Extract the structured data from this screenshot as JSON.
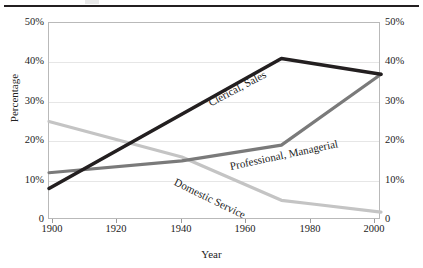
{
  "figure": {
    "has_top_rule": true
  },
  "axes": {
    "xlabel": "Year",
    "ylabel": "Percentage",
    "y_ticks_left": [
      "50%",
      "40%",
      "30%",
      "20%",
      "10%",
      "0"
    ],
    "y_ticks_right": [
      "50%",
      "40%",
      "30%",
      "20%",
      "10%",
      "0"
    ],
    "x_ticks": [
      "1900",
      "1920",
      "1940",
      "1960",
      "1980",
      "2000"
    ]
  },
  "colors": {
    "clerical": "#231f20",
    "professional": "#7a7a7a",
    "domestic": "#c4c4c4",
    "grid": "#e6e6e6",
    "frame": "#b9b9b9"
  },
  "chart_data": {
    "type": "line",
    "title": "",
    "xlabel": "Year",
    "ylabel": "Percentage",
    "xlim": [
      1900,
      2000
    ],
    "ylim": [
      0,
      50
    ],
    "grid": true,
    "legend_position": "inline-annotations",
    "y_tick_values": [
      0,
      10,
      20,
      30,
      40,
      50
    ],
    "x_tick_values": [
      1900,
      1920,
      1940,
      1960,
      1980,
      2000
    ],
    "dual_y_axis": true,
    "series": [
      {
        "name": "Clerical, Sales",
        "color": "#231f20",
        "x": [
          1900,
          1970,
          2000
        ],
        "values": [
          8,
          41,
          37
        ]
      },
      {
        "name": "Professional, Managerial",
        "color": "#7a7a7a",
        "x": [
          1900,
          1940,
          1970,
          2000
        ],
        "values": [
          12,
          15,
          19,
          37
        ]
      },
      {
        "name": "Domestic Service",
        "color": "#c4c4c4",
        "x": [
          1900,
          1940,
          1970,
          1980,
          2000
        ],
        "values": [
          25,
          16,
          5,
          4,
          2
        ]
      }
    ]
  }
}
